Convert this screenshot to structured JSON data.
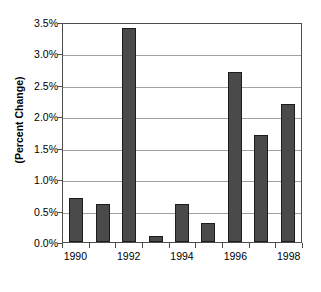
{
  "chart_data": {
    "type": "bar",
    "title": "",
    "subtitle": "",
    "xlabel": "",
    "ylabel": "(Percent Change)",
    "categories": [
      "1990",
      "1991",
      "1992",
      "1993",
      "1994",
      "1995",
      "1996",
      "1997",
      "1998"
    ],
    "values": [
      0.7,
      0.6,
      3.4,
      0.1,
      0.6,
      0.3,
      2.7,
      1.7,
      2.2
    ],
    "value_unit": "%",
    "ylim": [
      0.0,
      3.5
    ],
    "ytick_values": [
      0.0,
      0.5,
      1.0,
      1.5,
      2.0,
      2.5,
      3.0,
      3.5
    ],
    "ytick_labels": [
      "0.0%",
      "0.5%",
      "1.0%",
      "1.5%",
      "2.0%",
      "2.5%",
      "3.0%",
      "3.5%"
    ],
    "xtick_labels": [
      "1990",
      "1992",
      "1994",
      "1996",
      "1998"
    ],
    "xtick_label_categories": [
      "1990",
      "1992",
      "1994",
      "1996",
      "1998"
    ],
    "grid": true,
    "grid_axis": "y",
    "legend": false,
    "legend_position": "none",
    "bar_color": "#4a4a4a",
    "bar_border_color": "#1c1c1c",
    "gridline_color": "#a0a0a0",
    "frame_color": "#4d4d4d",
    "background_color": "#ffffff"
  }
}
